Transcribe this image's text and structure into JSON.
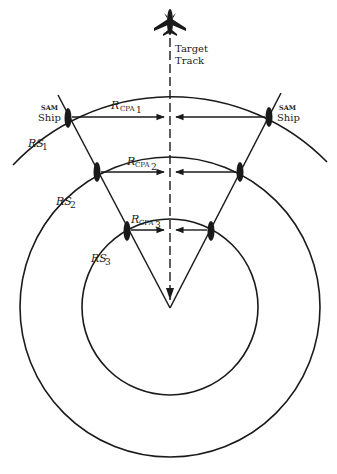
{
  "diagram": {
    "target": {
      "icon": "aircraft-icon",
      "label_line1": "Target",
      "label_line2": "Track"
    },
    "ships": {
      "left_label_top": "SAM",
      "left_label_bottom": "Ship",
      "right_label_top": "SAM",
      "right_label_bottom": "Ship"
    },
    "ranges": {
      "rs1": {
        "main": "RS",
        "sub": "1"
      },
      "rs2": {
        "main": "RS",
        "sub": "2"
      },
      "rs3": {
        "main": "RS",
        "sub": "3"
      }
    },
    "cpa": {
      "r1": {
        "main": "R",
        "sub": "CPA",
        "subsub": "1"
      },
      "r2": {
        "main": "R",
        "sub": "CPA",
        "subsub": "2"
      },
      "r3": {
        "main": "R",
        "sub": "CPA",
        "subsub": "3"
      }
    },
    "colors": {
      "ink": "#1a1a1a",
      "background": "#ffffff"
    }
  }
}
